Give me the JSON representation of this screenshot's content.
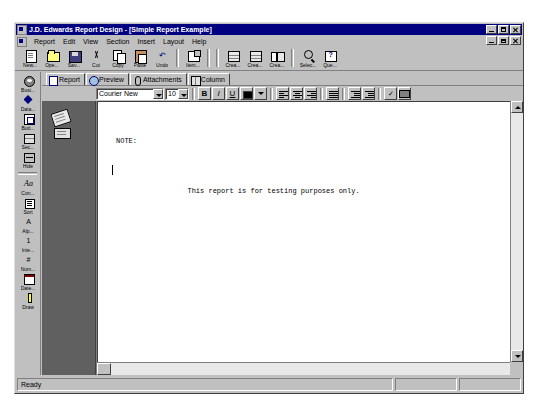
{
  "window": {
    "title": "J.D. Edwards Report Design - [Simple Report Example]",
    "app_icon": "application-icon",
    "controls": {
      "minimize": "minimize-button",
      "maximize": "maximize-button",
      "close": "close-button"
    },
    "mdi_controls": {
      "restore_down": "mdi-restore-button",
      "minimize": "mdi-minimize-button",
      "close": "mdi-close-button"
    }
  },
  "menu": {
    "doc_icon": "document-icon",
    "items": [
      {
        "label": "Report",
        "accel": "R"
      },
      {
        "label": "Edit",
        "accel": "E"
      },
      {
        "label": "View",
        "accel": "V"
      },
      {
        "label": "Section",
        "accel": "S"
      },
      {
        "label": "Insert",
        "accel": "I"
      },
      {
        "label": "Layout",
        "accel": "L"
      },
      {
        "label": "Help",
        "accel": "H"
      }
    ]
  },
  "toolbar": {
    "groups": [
      {
        "buttons": [
          {
            "label": "New...",
            "icon": "new-document-icon"
          },
          {
            "label": "Ope...",
            "icon": "open-folder-icon"
          },
          {
            "label": "Sav...",
            "icon": "save-disk-icon"
          },
          {
            "label": "Cut",
            "icon": "cut-scissors-icon"
          },
          {
            "label": "Copy",
            "icon": "copy-icon"
          },
          {
            "label": "Paste",
            "icon": "paste-icon"
          },
          {
            "label": "Undo",
            "icon": "undo-arrow-icon"
          }
        ]
      },
      {
        "buttons": [
          {
            "label": "Item...",
            "icon": "item-properties-icon"
          }
        ]
      },
      {
        "buttons": [
          {
            "label": "Crea...",
            "icon": "create-columnar-section-icon"
          },
          {
            "label": "Crea...",
            "icon": "create-group-section-icon"
          },
          {
            "label": "Crea...",
            "icon": "create-tabular-section-icon"
          },
          {
            "label": "Selec...",
            "icon": "select-magnifier-icon"
          },
          {
            "label": "Que...",
            "icon": "query-icon"
          }
        ]
      }
    ]
  },
  "sidebar": {
    "groups": [
      {
        "buttons": [
          {
            "label": "Busi...",
            "icon": "business-view-icon"
          },
          {
            "label": "Data...",
            "icon": "data-dictionary-icon"
          },
          {
            "label": "Butt...",
            "icon": "button-icon"
          },
          {
            "label": "Sec...",
            "icon": "section-icon"
          },
          {
            "label": "Hide",
            "icon": "hide-icon"
          }
        ]
      },
      {
        "buttons": [
          {
            "label": "Aa",
            "icon": "font-icon"
          },
          {
            "label": "Con...",
            "icon": "constant-icon"
          },
          {
            "label": "Sort",
            "icon": "sort-icon"
          },
          {
            "label": "Alp...",
            "icon": "alpha-variable-icon"
          },
          {
            "label": "Inte...",
            "icon": "integer-variable-icon"
          },
          {
            "label": "Num...",
            "icon": "numeric-variable-icon"
          },
          {
            "label": "Date...",
            "icon": "date-variable-icon"
          },
          {
            "label": "Draw",
            "icon": "draw-tool-icon"
          }
        ]
      }
    ]
  },
  "tabs": {
    "items": [
      {
        "label": "Report",
        "icon": "report-tab-icon",
        "selected": true
      },
      {
        "label": "Preview",
        "icon": "preview-tab-icon",
        "selected": false
      },
      {
        "label": "Attachments",
        "icon": "attachments-tab-icon",
        "selected": false
      },
      {
        "label": "Column",
        "icon": "column-tab-icon",
        "selected": false
      }
    ]
  },
  "format_toolbar": {
    "font_name": "Courier New",
    "font_size": "10",
    "bold_label": "B",
    "italic_label": "I",
    "underline_label": "U",
    "text_color": "#000000",
    "buttons": [
      {
        "name": "bold-button",
        "label": "B"
      },
      {
        "name": "italic-button",
        "label": "I"
      },
      {
        "name": "underline-button",
        "label": "U"
      },
      {
        "name": "text-color-button",
        "label": ""
      },
      {
        "name": "align-left-button",
        "label": ""
      },
      {
        "name": "align-center-button",
        "label": ""
      },
      {
        "name": "align-right-button",
        "label": ""
      },
      {
        "name": "bullet-list-button",
        "label": ""
      },
      {
        "name": "decrease-indent-button",
        "label": ""
      },
      {
        "name": "increase-indent-button",
        "label": ""
      },
      {
        "name": "spell-check-button",
        "label": ""
      },
      {
        "name": "print-button",
        "label": ""
      }
    ]
  },
  "document": {
    "line1": "NOTE:",
    "line2": "     This report is for testing purposes only."
  },
  "gutter": {
    "icon1": "attachment-note-icon",
    "icon2": "attachment-text-icon"
  },
  "statusbar": {
    "message": "Ready",
    "pane2": "",
    "pane3": ""
  },
  "colors": {
    "titlebar": "#000080",
    "face": "#c0c0c0",
    "canvas": "#808080",
    "page": "#ffffff"
  }
}
